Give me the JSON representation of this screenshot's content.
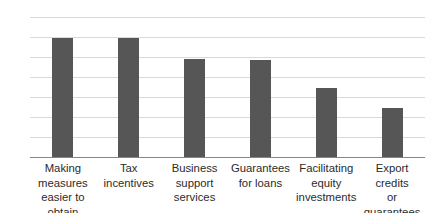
{
  "chart_data": {
    "type": "bar",
    "title": "",
    "subtitle": "",
    "xlabel": "",
    "ylabel": "",
    "ylim": [
      0,
      7
    ],
    "grid": true,
    "legend": false,
    "orientation": "vertical",
    "bar_color": "#565656",
    "gridline_color": "#d9d9d9",
    "axis_color": "#868686",
    "background": "#ffffff",
    "yticks": [
      0,
      1,
      2,
      3,
      4,
      5,
      6,
      7
    ],
    "ytick_labels": [
      "0",
      "1",
      "2",
      "3",
      "4",
      "5",
      "6",
      "7"
    ],
    "categories": [
      "Making measures easier to obtain",
      "Tax incentives",
      "Business support services",
      "Guarantees for loans",
      "Facilitating equity investments",
      "Export credits or guarantees"
    ],
    "category_lines": [
      [
        "Making",
        "measures",
        "easier to obtain"
      ],
      [
        "Tax incentives"
      ],
      [
        "Business",
        "support",
        "services"
      ],
      [
        "Guarantees",
        "for loans"
      ],
      [
        "Facilitating",
        "equity",
        "investments"
      ],
      [
        "Export credits",
        "or guarantees"
      ]
    ],
    "values": [
      5.95,
      5.95,
      4.9,
      4.85,
      3.45,
      2.45
    ]
  }
}
